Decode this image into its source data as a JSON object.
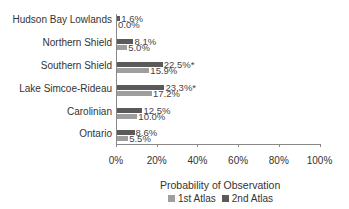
{
  "chart_data": {
    "type": "bar",
    "orientation": "horizontal",
    "categories": [
      "Hudson Bay Lowlands",
      "Northern Shield",
      "Southern Shield",
      "Lake Simcoe-Rideau",
      "Carolinian",
      "Ontario"
    ],
    "series": [
      {
        "name": "2nd Atlas",
        "color": "#5a5a5a",
        "values": [
          1.6,
          8.1,
          22.5,
          23.3,
          12.5,
          8.6
        ],
        "labels": [
          "1.6%",
          "8.1%",
          "22.5%*",
          "23.3%*",
          "12.5%",
          "8.6%"
        ]
      },
      {
        "name": "1st Atlas",
        "color": "#9e9e9e",
        "values": [
          0.0,
          5.0,
          15.9,
          17.2,
          10.0,
          5.5
        ],
        "labels": [
          "0.0%",
          "5.0%",
          "15.9%",
          "17.2%",
          "10.0%",
          "5.5%"
        ]
      }
    ],
    "xlabel": "Probability of Observation",
    "ylabel": "",
    "xlim": [
      0,
      100
    ],
    "xticks": [
      "0%",
      "20%",
      "40%",
      "60%",
      "80%",
      "100%"
    ],
    "grid": false,
    "legend": {
      "position": "bottom",
      "entries": [
        "1st Atlas",
        "2nd Atlas"
      ]
    }
  }
}
